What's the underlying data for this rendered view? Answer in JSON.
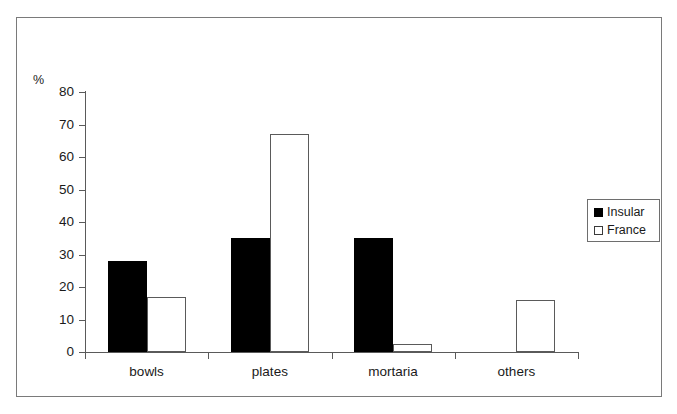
{
  "chart_data": {
    "type": "bar",
    "title": "",
    "subtitle": "",
    "xlabel": "",
    "ylabel": "%",
    "ylim": [
      0,
      80
    ],
    "y_ticks": [
      0,
      10,
      20,
      30,
      40,
      50,
      60,
      70,
      80
    ],
    "y_tick_labels": [
      "0",
      "10",
      "20",
      "30",
      "40",
      "50",
      "60",
      "70",
      "80"
    ],
    "grid": false,
    "legend_position": "right",
    "categories": [
      "bowls",
      "plates",
      "mortaria",
      "others"
    ],
    "series": [
      {
        "name": "Insular",
        "color": "#000000",
        "fill": "solid",
        "values": [
          28,
          35,
          35,
          0
        ]
      },
      {
        "name": "France",
        "color": "#ffffff",
        "border_color": "#5a5a5a",
        "fill": "hollow",
        "values": [
          17,
          67,
          2.5,
          16
        ]
      }
    ]
  },
  "legend": {
    "items": [
      {
        "label": "Insular",
        "swatch": "filled-square-icon"
      },
      {
        "label": "France",
        "swatch": "hollow-square-icon"
      }
    ]
  }
}
